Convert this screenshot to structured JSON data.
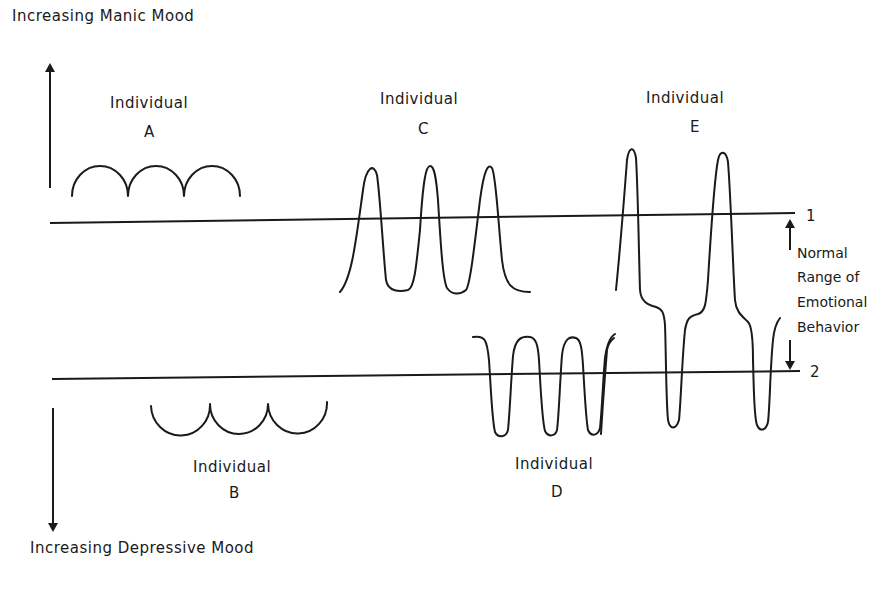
{
  "axis": {
    "top_label": "Increasing  Manic  Mood",
    "bottom_label": "Increasing  Depressive  Mood"
  },
  "lines": {
    "upper_label": "1",
    "lower_label": "2"
  },
  "normal_range": {
    "line1": "Normal",
    "line2": "Range of",
    "line3": "Emotional",
    "line4": "Behavior"
  },
  "individuals": [
    {
      "title": "Individual",
      "letter": "A",
      "pattern": "mild elevated arcs above normal range"
    },
    {
      "title": "Individual",
      "letter": "B",
      "pattern": "mild depressed arcs below normal range"
    },
    {
      "title": "Individual",
      "letter": "C",
      "pattern": "manic peaks crossing upper line"
    },
    {
      "title": "Individual",
      "letter": "D",
      "pattern": "depressive troughs crossing lower line"
    },
    {
      "title": "Individual",
      "letter": "E",
      "pattern": "alternating manic peaks and depressive troughs"
    }
  ],
  "colors": {
    "ink": "#1a1a1a",
    "background": "#ffffff"
  }
}
